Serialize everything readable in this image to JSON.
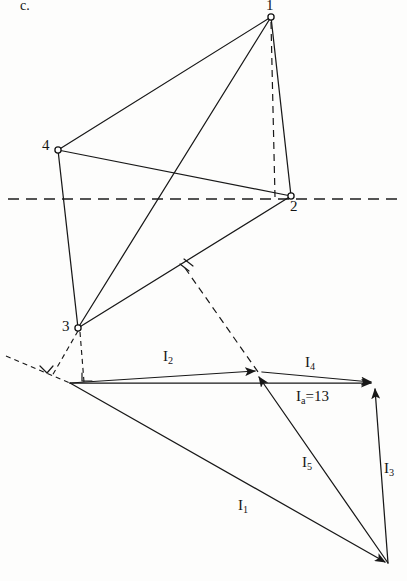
{
  "figure": {
    "section_label": "c.",
    "width": 407,
    "height": 581,
    "ink_color": "#181818",
    "paper_color": "#fdfdfc"
  },
  "tetrahedron": {
    "vertex_labels": {
      "v1": "1",
      "v2": "2",
      "v3": "3",
      "v4": "4"
    },
    "vertices": [
      {
        "name": "1",
        "x": 271,
        "y": 17
      },
      {
        "name": "2",
        "x": 291,
        "y": 196
      },
      {
        "name": "3",
        "x": 78,
        "y": 328
      },
      {
        "name": "4",
        "x": 58,
        "y": 150
      }
    ],
    "solid_edges": [
      {
        "from": "1",
        "to": "4"
      },
      {
        "from": "1",
        "to": "2"
      },
      {
        "from": "1",
        "to": "3"
      },
      {
        "from": "4",
        "to": "2"
      },
      {
        "from": "4",
        "to": "3"
      },
      {
        "from": "3",
        "to": "2"
      }
    ],
    "dashed_edges": [
      {
        "from": "1",
        "to": "2",
        "note": "vertical hidden line"
      }
    ]
  },
  "ground_axis": {
    "name": "ground-line",
    "x1": 8,
    "y1": 199,
    "x2": 400,
    "y2": 199
  },
  "projection": {
    "foot_point": {
      "x": 185,
      "y": 268
    },
    "apex_point": {
      "x": 258,
      "y": 372
    },
    "right_angle_marks": 3
  },
  "vector_polygon": {
    "origin": {
      "x": 70,
      "y": 383
    },
    "apex": {
      "x": 258,
      "y": 372
    },
    "right": {
      "x": 374,
      "y": 383
    },
    "bottom": {
      "x": 388,
      "y": 565
    },
    "vectors": [
      {
        "id": "I2",
        "label": "I",
        "sub": "2",
        "from": "origin",
        "to": "apex",
        "label_x": 163,
        "label_y": 349
      },
      {
        "id": "I4",
        "label": "I",
        "sub": "4",
        "from": "apex",
        "to": "right",
        "label_x": 305,
        "label_y": 355
      },
      {
        "id": "Ia",
        "label": "I",
        "sub": "a",
        "suffix": "=13",
        "from": "origin",
        "to": "right",
        "label_x": 296,
        "label_y": 389
      },
      {
        "id": "I3",
        "label": "I",
        "sub": "3",
        "from": "bottom",
        "to": "right",
        "label_x": 384,
        "label_y": 461
      },
      {
        "id": "I5",
        "label": "I",
        "sub": "5",
        "from": "bottom",
        "to": "apex",
        "label_x": 302,
        "label_y": 455
      },
      {
        "id": "I1",
        "label": "I",
        "sub": "1",
        "from": "origin",
        "to": "bottom",
        "label_x": 238,
        "label_y": 498
      }
    ],
    "resultant_text": "Ia=13",
    "resultant_value": "13"
  }
}
